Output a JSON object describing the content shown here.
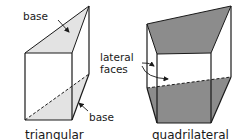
{
  "diagram": {
    "type": "prism-illustration",
    "colors": {
      "stroke": "#1a1a1a",
      "triangular_base_fill": "#e3e3e3",
      "quadrilateral_base_fill": "#8c8c8c",
      "background": "#ffffff"
    },
    "labels": {
      "top_base": "base",
      "bottom_base": "base",
      "lateral_line1": "lateral",
      "lateral_line2": "faces"
    },
    "captions": {
      "left_prism": "triangular",
      "right_prism": "quadrilateral"
    }
  }
}
